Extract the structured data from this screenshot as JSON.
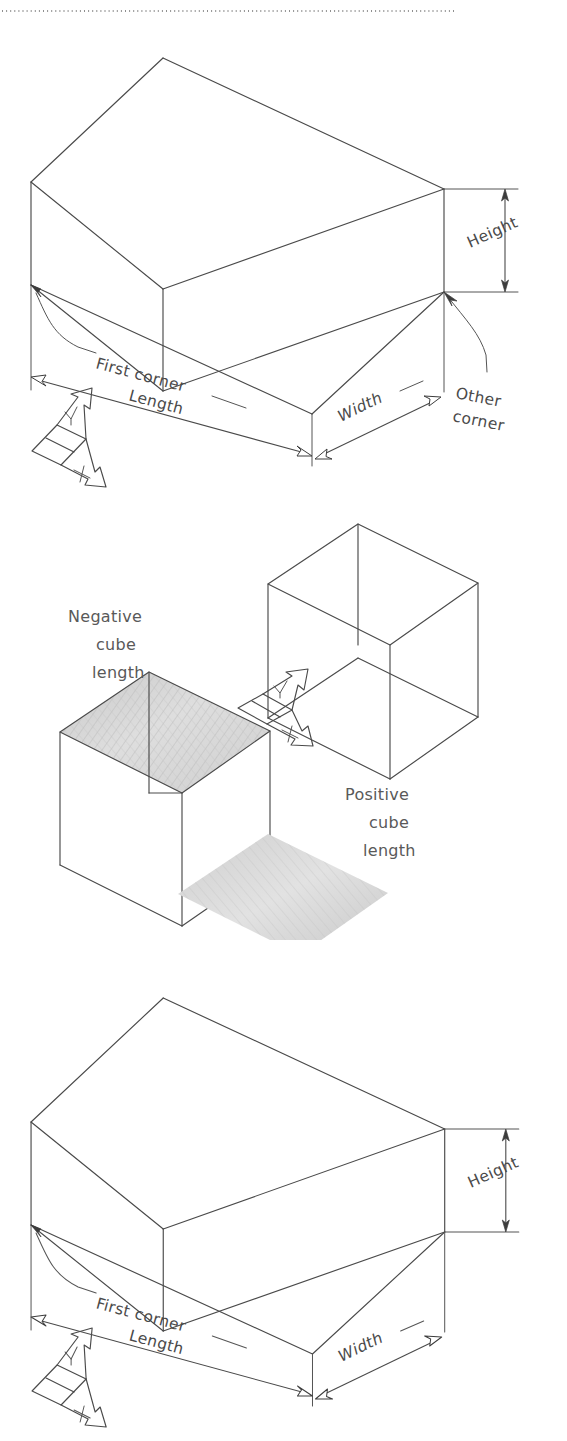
{
  "document": {
    "type": "technical-illustration",
    "figure_count": 3,
    "background_color": "#ffffff",
    "line_color": "#4a4a4a",
    "text_color": "#4a4a4a"
  },
  "divider": {
    "name": "dotted-rule",
    "style": "dotted"
  },
  "figures": [
    {
      "id": "box-dimensions-top",
      "kind": "isometric-box",
      "labels": {
        "height": "Height",
        "length": "Length",
        "width": "Width",
        "first_corner": "First  corner",
        "other_corner_line1": "Other",
        "other_corner_line2": "corner"
      },
      "axis_indicator": {
        "name": "xy-axis-arrows",
        "y_label": "Y",
        "x_label": "X"
      }
    },
    {
      "id": "cube-length-sign",
      "kind": "isometric-cube-pair",
      "labels": {
        "negative_line1": "Negative",
        "negative_line2": "cube",
        "negative_line3": "length",
        "positive_line1": "Positive",
        "positive_line2": "cube",
        "positive_line3": "length"
      },
      "axis_indicator": {
        "name": "xy-axis-arrows",
        "y_label": "Y",
        "x_label": "X"
      }
    },
    {
      "id": "box-dimensions-bottom",
      "kind": "isometric-box",
      "labels": {
        "height": "Height",
        "length": "Length",
        "width": "Width",
        "first_corner": "First  corner"
      },
      "axis_indicator": {
        "name": "xy-axis-arrows",
        "y_label": "Y",
        "x_label": "X"
      }
    }
  ]
}
